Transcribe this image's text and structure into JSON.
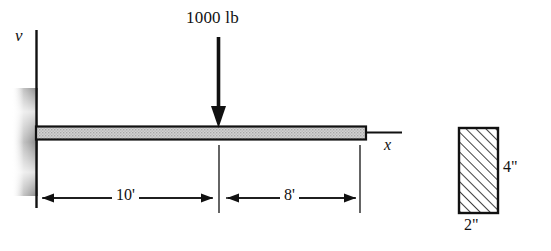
{
  "figure": {
    "axes": {
      "vertical_label": "v",
      "horizontal_label": "x"
    },
    "load": {
      "label": "1000 lb",
      "direction": "down",
      "position_from_wall": "10'"
    },
    "dimensions": {
      "segment_1": "10'",
      "segment_2": "8'"
    },
    "cross_section": {
      "height_label": "4\"",
      "width_label": "2\"",
      "hatch": "diagonal"
    },
    "colors": {
      "line": "#111111",
      "beam_fill": "#c9c9c9",
      "wall_shade": "#9a9a9a",
      "background": "#ffffff"
    }
  }
}
